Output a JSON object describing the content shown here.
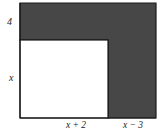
{
  "figure": {
    "type": "geometry-diagram",
    "colors": {
      "shaded_fill": "#474747",
      "unshaded_fill": "#ffffff",
      "outline": "#1a1a1a",
      "label_text": "#1c1c1c",
      "background": "#ffffff"
    },
    "labels": {
      "top_band_height": "4",
      "inner_height": "x",
      "inner_width": "x + 2",
      "right_width": "x − 3"
    },
    "geometry": {
      "outer_left": 20,
      "outer_top": 3,
      "outer_right": 156,
      "outer_bottom": 118,
      "notch_left": 20,
      "notch_top": 40,
      "notch_right": 108,
      "notch_bottom": 118
    }
  }
}
